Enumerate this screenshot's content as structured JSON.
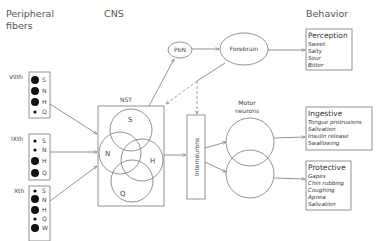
{
  "headers": {
    "peripheral_line1": "Peripheral",
    "peripheral_line2": "fibers",
    "cns": "CNS",
    "behavior": "Behavior"
  },
  "nerves": [
    {
      "label": "VIIth",
      "receptors": [
        {
          "letter": "S",
          "size": "large"
        },
        {
          "letter": "N",
          "size": "large"
        },
        {
          "letter": "H",
          "size": "large"
        },
        {
          "letter": "Q",
          "size": "small"
        }
      ]
    },
    {
      "label": "IXth",
      "receptors": [
        {
          "letter": "S",
          "size": "small"
        },
        {
          "letter": "N",
          "size": "small"
        },
        {
          "letter": "H",
          "size": "large"
        },
        {
          "letter": "Q",
          "size": "large"
        }
      ]
    },
    {
      "label": "Xth",
      "receptors": [
        {
          "letter": "S",
          "size": "small"
        },
        {
          "letter": "N",
          "size": "large"
        },
        {
          "letter": "H",
          "size": "large"
        },
        {
          "letter": "Q",
          "size": "small"
        },
        {
          "letter": "W",
          "size": "large"
        }
      ]
    }
  ],
  "nst": {
    "label": "NST",
    "circles": [
      "S",
      "N",
      "H",
      "Q"
    ]
  },
  "pbn": "PbN",
  "forebrain": "Forebrain",
  "interneurons": "Interneurons",
  "motor_neurons": {
    "line1": "Motor",
    "line2": "neurons"
  },
  "behaviors": {
    "perception": {
      "title": "Perception",
      "items": [
        "Sweet",
        "Salty",
        "Sour",
        "Bitter"
      ]
    },
    "ingestive": {
      "title": "Ingestive",
      "items": [
        "Tongue protrusions",
        "Salivation",
        "Insulin release",
        "Swallowing"
      ]
    },
    "protective": {
      "title": "Protective",
      "items": [
        "Gapes",
        "Chin rubbing",
        "Coughing",
        "Apnea",
        "Salivation"
      ]
    }
  }
}
